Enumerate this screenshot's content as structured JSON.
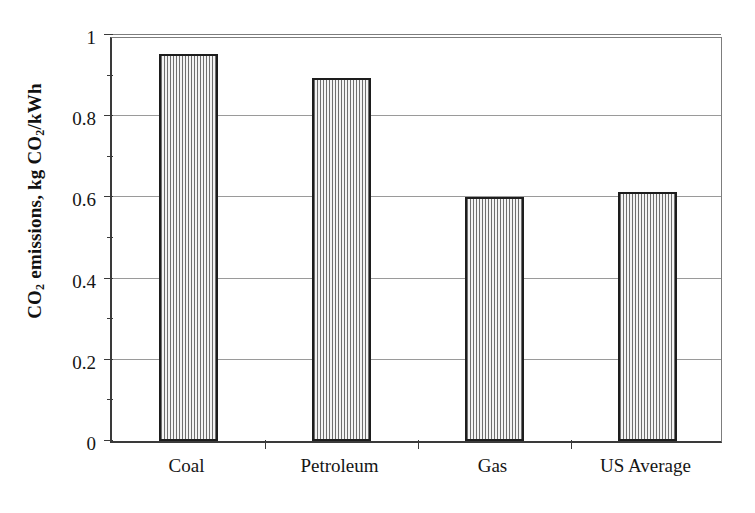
{
  "chart_data": {
    "type": "bar",
    "title": "",
    "xlabel": "",
    "ylabel": "CO2 emissions, kg CO2/kWh",
    "ylabel_parts": [
      {
        "text": "CO"
      },
      {
        "text": "2",
        "sub": true
      },
      {
        "text": " emissions, kg CO"
      },
      {
        "text": "2",
        "sub": true
      },
      {
        "text": "/kWh"
      }
    ],
    "categories": [
      "Coal",
      "Petroleum",
      "Gas",
      "US Average"
    ],
    "values": [
      0.953,
      0.895,
      0.602,
      0.613
    ],
    "ylim": [
      0,
      1
    ],
    "xlim_categories": 4,
    "y_ticks": [
      0,
      0.2,
      0.4,
      0.6,
      0.8,
      1
    ],
    "y_tick_labels": [
      "0",
      "0.2",
      "0.4",
      "0.6",
      "0.8",
      "1"
    ],
    "y_minor_ticks": [
      0.1,
      0.3,
      0.5,
      0.7,
      0.9
    ],
    "grid": true,
    "grid_axis": "y",
    "legend": false,
    "legend_position": "none",
    "bar_fill": "vertical-hatch",
    "bar_edge_color": "#1d1d1d",
    "bar_face_color": "#e9e9e9",
    "grid_color": "#9a9a9a",
    "axis_color": "#3a3a3a",
    "background_color": "#ffffff",
    "bar_width_fraction": 0.39
  }
}
